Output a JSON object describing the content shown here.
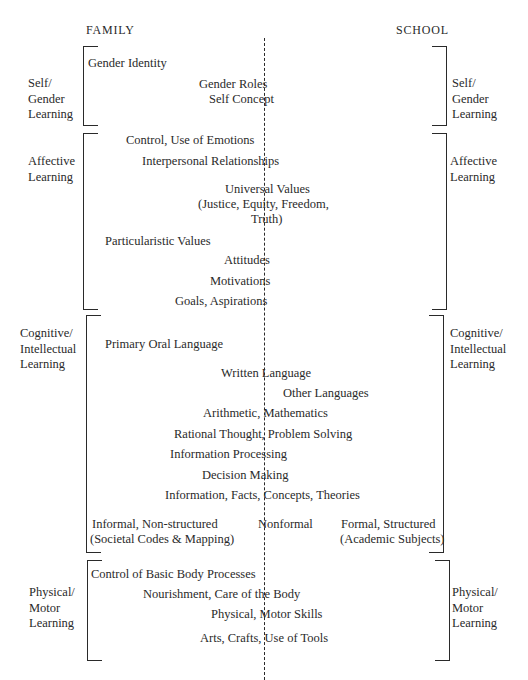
{
  "headers": {
    "left": "FAMILY",
    "right": "SCHOOL"
  },
  "categories": [
    {
      "id": "self",
      "line1": "Self/",
      "line2": "Gender",
      "line3": "Learning"
    },
    {
      "id": "affective",
      "line1": "Affective",
      "line2": "Learning"
    },
    {
      "id": "cognitive",
      "line1": "Cognitive/",
      "line2": "Intellectual",
      "line3": "Learning"
    },
    {
      "id": "physical",
      "line1": "Physical/",
      "line2": "Motor",
      "line3": "Learning"
    }
  ],
  "items": {
    "self": [
      "Gender Identity",
      "Gender Roles",
      "Self Concept"
    ],
    "affective": [
      "Control, Use of Emotions",
      "Interpersonal Relationships",
      "Universal Values",
      "(Justice, Equity, Freedom,",
      "Truth)",
      "Particularistic Values",
      "Attitudes",
      "Motivations",
      "Goals, Aspirations"
    ],
    "cognitive": [
      "Primary Oral Language",
      "Written Language",
      "Other Languages",
      "Arithmetic, Mathematics",
      "Rational Thought, Problem Solving",
      "Information Processing",
      "Decision Making",
      "Information, Facts, Concepts, Theories"
    ],
    "modes": {
      "informal": "Informal, Non-structured",
      "informal_sub": "(Societal Codes & Mapping)",
      "nonformal": "Nonformal",
      "formal": "Formal, Structured",
      "formal_sub": "(Academic Subjects)"
    },
    "physical": [
      "Control of Basic Body Processes",
      "Nourishment, Care of the Body",
      "Physical, Motor Skills",
      "Arts, Crafts, Use of Tools"
    ]
  }
}
